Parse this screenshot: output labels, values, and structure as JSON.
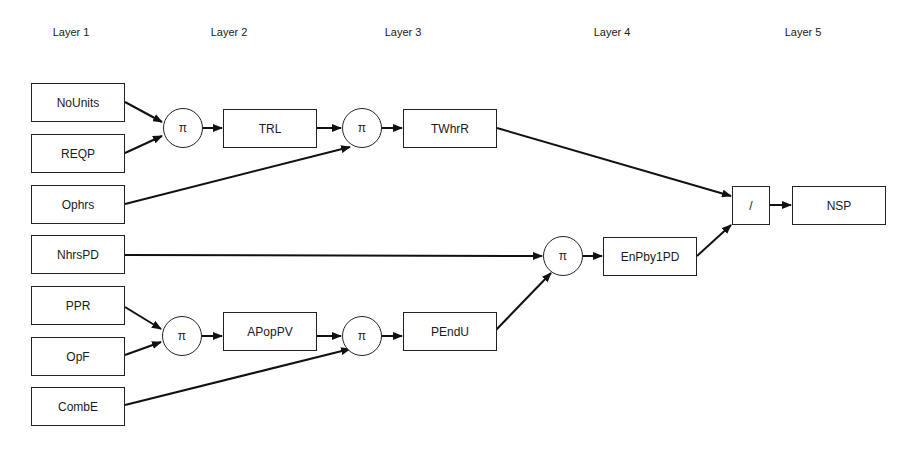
{
  "layers": [
    {
      "label": "Layer 1",
      "x": 71
    },
    {
      "label": "Layer 2",
      "x": 229
    },
    {
      "label": "Layer 3",
      "x": 403
    },
    {
      "label": "Layer 4",
      "x": 612
    },
    {
      "label": "Layer 5",
      "x": 803
    }
  ],
  "nodes": {
    "nounits": {
      "label": "NoUnits"
    },
    "reqp": {
      "label": "REQP"
    },
    "ophrs": {
      "label": "Ophrs"
    },
    "nhrspd": {
      "label": "NhrsPD"
    },
    "ppr": {
      "label": "PPR"
    },
    "opf": {
      "label": "OpF"
    },
    "combe": {
      "label": "CombE"
    },
    "pi1": {
      "label": "π"
    },
    "trl": {
      "label": "TRL"
    },
    "pi2": {
      "label": "π"
    },
    "twhrr": {
      "label": "TWhrR"
    },
    "pi3": {
      "label": "π"
    },
    "apoppv": {
      "label": "APopPV"
    },
    "pi4": {
      "label": "π"
    },
    "pendu": {
      "label": "PEndU"
    },
    "pi5": {
      "label": "π"
    },
    "enpby1pd": {
      "label": "EnPby1PD"
    },
    "div": {
      "label": "/"
    },
    "nsp": {
      "label": "NSP"
    }
  },
  "edges": [
    [
      "NoUnits",
      "π (1)"
    ],
    [
      "REQP",
      "π (1)"
    ],
    [
      "π (1)",
      "TRL"
    ],
    [
      "TRL",
      "π (2)"
    ],
    [
      "Ophrs",
      "π (2)"
    ],
    [
      "π (2)",
      "TWhrR"
    ],
    [
      "TWhrR",
      "/"
    ],
    [
      "NhrsPD",
      "π (5)"
    ],
    [
      "PPR",
      "π (3)"
    ],
    [
      "OpF",
      "π (3)"
    ],
    [
      "π (3)",
      "APopPV"
    ],
    [
      "APopPV",
      "π (4)"
    ],
    [
      "CombE",
      "π (4)"
    ],
    [
      "π (4)",
      "PEndU"
    ],
    [
      "PEndU",
      "π (5)"
    ],
    [
      "π (5)",
      "EnPby1PD"
    ],
    [
      "EnPby1PD",
      "/"
    ],
    [
      "/",
      "NSP"
    ]
  ]
}
